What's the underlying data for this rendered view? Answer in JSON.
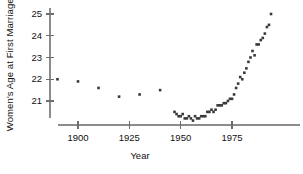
{
  "chart_data": {
    "type": "scatter",
    "title": "",
    "xlabel": "Year",
    "ylabel": "Women's Age at First Marriage",
    "xlim": [
      1886,
      1998
    ],
    "ylim": [
      20.1,
      25.2
    ],
    "grid": false,
    "legend": null,
    "xticks": [
      1900,
      1925,
      1950,
      1975
    ],
    "xtick_labels": [
      "1900",
      "1925",
      "1950",
      "1975"
    ],
    "yticks": [
      21,
      22,
      23,
      24,
      25
    ],
    "ytick_labels": [
      "21",
      "22",
      "23",
      "24",
      "25"
    ],
    "marker": "square",
    "marker_color": "#3a3a3a",
    "marker_size": 2.6,
    "x": [
      1890,
      1900,
      1910,
      1920,
      1930,
      1940,
      1947,
      1948,
      1949,
      1950,
      1951,
      1952,
      1953,
      1954,
      1955,
      1956,
      1957,
      1958,
      1959,
      1960,
      1961,
      1962,
      1963,
      1964,
      1965,
      1966,
      1967,
      1968,
      1969,
      1970,
      1971,
      1972,
      1973,
      1974,
      1975,
      1976,
      1977,
      1978,
      1979,
      1980,
      1981,
      1982,
      1983,
      1984,
      1985,
      1986,
      1987,
      1988,
      1989,
      1990,
      1991,
      1992,
      1993,
      1994
    ],
    "y": [
      22.0,
      21.9,
      21.6,
      21.2,
      21.3,
      21.5,
      20.5,
      20.4,
      20.3,
      20.3,
      20.4,
      20.2,
      20.2,
      20.3,
      20.2,
      20.1,
      20.3,
      20.2,
      20.2,
      20.3,
      20.3,
      20.3,
      20.5,
      20.5,
      20.6,
      20.5,
      20.6,
      20.8,
      20.8,
      20.8,
      20.9,
      20.9,
      21.0,
      21.1,
      21.1,
      21.3,
      21.6,
      21.8,
      22.1,
      22.0,
      22.3,
      22.5,
      22.8,
      23.0,
      23.3,
      23.1,
      23.6,
      23.6,
      23.8,
      23.9,
      24.1,
      24.4,
      24.5,
      25.0
    ]
  },
  "axes": {
    "ylabel_text": "Women's Age at First Marriage",
    "xlabel_text": "Year"
  }
}
